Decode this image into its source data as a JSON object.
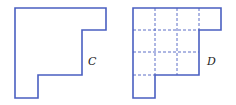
{
  "figures": [
    {
      "label": "C",
      "description": "L-shaped staircase polygon outline"
    },
    {
      "label": "D",
      "description": "Same polygon subdivided into unit squares with dashed lines"
    }
  ],
  "colors": {
    "outline": "#4a5fc1",
    "label": "#222222"
  }
}
